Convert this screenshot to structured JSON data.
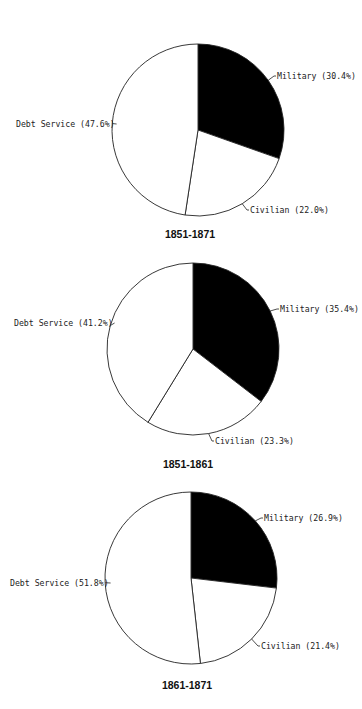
{
  "chart_data": [
    {
      "type": "pie",
      "title": "1851-1871",
      "start_angle": "12 o'clock, clockwise",
      "slices": [
        {
          "name": "Military",
          "value": 30.4,
          "label": "Military (30.4%)",
          "color": "#000000"
        },
        {
          "name": "Civilian",
          "value": 22.0,
          "label": "Civilian (22.0%)",
          "color": "#ffffff"
        },
        {
          "name": "Debt Service",
          "value": 47.6,
          "label": "Debt Service (47.6%)",
          "color": "#ffffff"
        }
      ],
      "center": [
        198,
        130
      ],
      "radius": 86,
      "label_pos": [
        [
          277,
          79
        ],
        [
          250,
          213
        ],
        [
          16,
          127
        ]
      ],
      "title_pos": [
        190,
        238
      ]
    },
    {
      "type": "pie",
      "title": "1851-1861",
      "start_angle": "12 o'clock, clockwise",
      "slices": [
        {
          "name": "Military",
          "value": 35.4,
          "label": "Military (35.4%)",
          "color": "#000000"
        },
        {
          "name": "Civilian",
          "value": 23.3,
          "label": "Civilian (23.3%)",
          "color": "#ffffff"
        },
        {
          "name": "Debt Service",
          "value": 41.2,
          "label": "Debt Service (41.2%)",
          "color": "#ffffff"
        }
      ],
      "center": [
        193,
        349
      ],
      "radius": 86,
      "label_pos": [
        [
          280,
          312
        ],
        [
          215,
          444
        ],
        [
          14,
          326
        ]
      ],
      "title_pos": [
        188,
        468
      ]
    },
    {
      "type": "pie",
      "title": "1861-1871",
      "start_angle": "12 o'clock, clockwise",
      "slices": [
        {
          "name": "Military",
          "value": 26.9,
          "label": "Military (26.9%)",
          "color": "#000000"
        },
        {
          "name": "Civilian",
          "value": 21.4,
          "label": "Civilian (21.4%)",
          "color": "#ffffff"
        },
        {
          "name": "Debt Service",
          "value": 51.8,
          "label": "Debt Service (51.8%)",
          "color": "#ffffff"
        }
      ],
      "center": [
        191,
        578
      ],
      "radius": 86,
      "label_pos": [
        [
          264,
          521
        ],
        [
          261,
          649
        ],
        [
          10,
          586
        ]
      ],
      "title_pos": [
        187,
        689
      ]
    }
  ]
}
